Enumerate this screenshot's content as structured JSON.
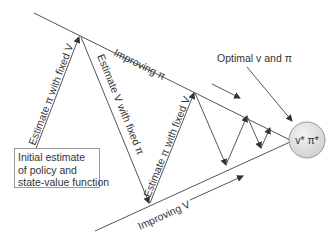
{
  "diagram": {
    "labels": {
      "improving_pi": "Improving π",
      "improving_v": "Improving V",
      "estimate_pi_1": "Estimate π with fixed V",
      "estimate_v": "Estimate V with fixed π",
      "estimate_pi_2": "Estimate π with fixed V",
      "optimal": "Optimal v and π",
      "optimum_node": "v* π*"
    },
    "initial_box": {
      "lines": [
        "Initial estimate",
        "of policy and",
        "state-value function"
      ]
    },
    "colors": {
      "line": "#555555",
      "text": "#333333",
      "circle_fill": "#e3e3e3",
      "circle_stroke": "#9a9a9a"
    }
  }
}
